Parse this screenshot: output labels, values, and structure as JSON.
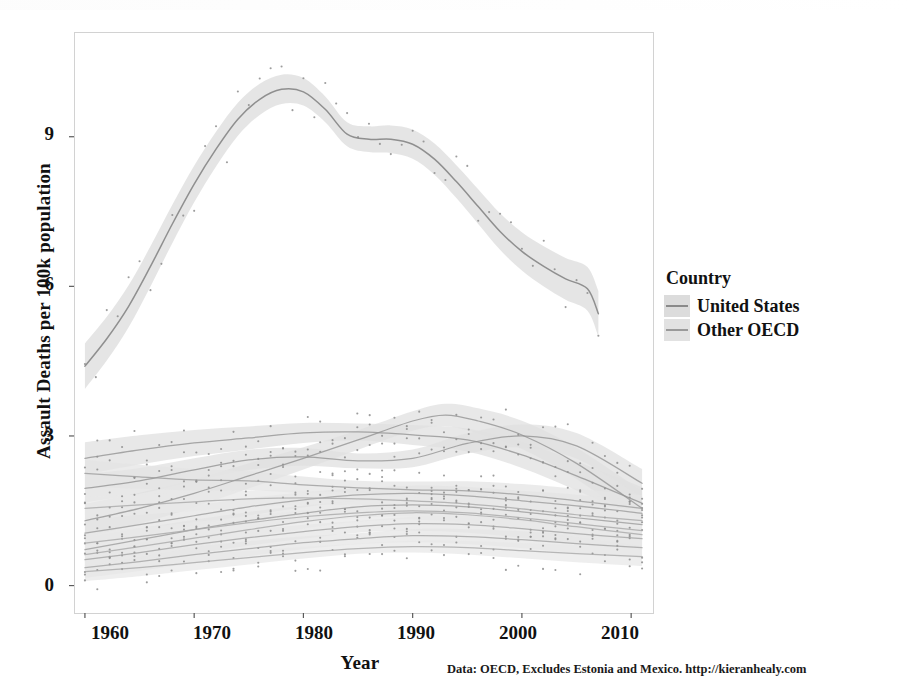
{
  "chart_data": {
    "type": "line",
    "title": "",
    "xlabel": "Year",
    "ylabel": "Assault Deaths per 100k population",
    "caption": "Data: OECD, Excludes Estonia and Mexico. http://kieranhealy.com",
    "xlim": [
      1959,
      2012
    ],
    "ylim": [
      -0.55,
      11.1
    ],
    "xticks": [
      1960,
      1970,
      1980,
      1990,
      2000,
      2010
    ],
    "yticks": [
      0,
      3,
      6,
      9
    ],
    "grid": false,
    "legend": {
      "title": "Country",
      "position": "right",
      "entries": [
        {
          "label": "United States",
          "line_color": "#8f8f8f",
          "ribbon_color": "#dedede"
        },
        {
          "label": "Other OECD",
          "line_color": "#9a9a9a",
          "ribbon_color": "#e2e2e2"
        }
      ]
    },
    "smoother": "loess with 95% confidence ribbon",
    "series": [
      {
        "name": "United States",
        "group": "United States",
        "line_color": "#8a8a8a",
        "ribbon_color": "#dcdcdc",
        "ribbon_halfwidth": 0.24,
        "x": [
          1960,
          1962,
          1964,
          1966,
          1968,
          1970,
          1972,
          1974,
          1976,
          1978,
          1980,
          1982,
          1984,
          1986,
          1988,
          1990,
          1992,
          1994,
          1996,
          1998,
          2000,
          2002,
          2004,
          2006,
          2007
        ],
        "y": [
          4.4,
          4.95,
          5.6,
          6.4,
          7.25,
          8.05,
          8.75,
          9.35,
          9.75,
          9.95,
          9.9,
          9.55,
          9.05,
          8.95,
          8.95,
          8.85,
          8.55,
          8.1,
          7.6,
          7.1,
          6.7,
          6.4,
          6.15,
          5.95,
          5.45
        ]
      },
      {
        "name": "Other OECD high band A",
        "group": "Other OECD",
        "line_color": "#949494",
        "ribbon_color": "#e0e0e0",
        "ribbon_halfwidth": 0.17,
        "x": [
          1960,
          1965,
          1970,
          1975,
          1980,
          1985,
          1990,
          1995,
          2000,
          2005,
          2011
        ],
        "y": [
          2.55,
          2.72,
          2.86,
          2.96,
          3.06,
          3.08,
          3.02,
          2.92,
          2.62,
          2.2,
          1.65
        ]
      },
      {
        "name": "Other OECD high band B",
        "group": "Other OECD",
        "line_color": "#949494",
        "ribbon_color": "#e0e0e0",
        "ribbon_halfwidth": 0.18,
        "x": [
          1960,
          1965,
          1970,
          1975,
          1980,
          1985,
          1990,
          1993,
          1996,
          2000,
          2005,
          2011
        ],
        "y": [
          1.3,
          1.55,
          1.85,
          2.2,
          2.55,
          2.92,
          3.3,
          3.42,
          3.3,
          3.02,
          2.45,
          1.55
        ]
      },
      {
        "name": "Other OECD high band C",
        "group": "Other OECD",
        "line_color": "#949494",
        "ribbon_color": "#e0e0e0",
        "ribbon_halfwidth": 0.15,
        "x": [
          1960,
          1965,
          1970,
          1975,
          1980,
          1985,
          1990,
          1995,
          2000,
          2005,
          2011
        ],
        "y": [
          1.95,
          2.1,
          2.32,
          2.52,
          2.58,
          2.5,
          2.55,
          2.85,
          3.0,
          2.8,
          2.05
        ]
      },
      {
        "name": "Other OECD mid band D",
        "group": "Other OECD",
        "line_color": "#9c9c9c",
        "ribbon_color": "#e4e4e4",
        "ribbon_halfwidth": 0.14,
        "x": [
          1960,
          1965,
          1970,
          1975,
          1980,
          1985,
          1990,
          1995,
          2000,
          2005,
          2011
        ],
        "y": [
          2.25,
          2.18,
          2.12,
          2.1,
          2.02,
          1.96,
          1.92,
          1.9,
          1.82,
          1.7,
          1.55
        ]
      },
      {
        "name": "Other OECD mid band E",
        "group": "Other OECD",
        "line_color": "#9c9c9c",
        "ribbon_color": "#e4e4e4",
        "ribbon_halfwidth": 0.13,
        "x": [
          1960,
          1965,
          1970,
          1975,
          1980,
          1985,
          1990,
          1995,
          2000,
          2005,
          2011
        ],
        "y": [
          1.05,
          1.22,
          1.4,
          1.58,
          1.72,
          1.82,
          1.85,
          1.8,
          1.7,
          1.6,
          1.45
        ]
      },
      {
        "name": "Other OECD mid band F",
        "group": "Other OECD",
        "line_color": "#9c9c9c",
        "ribbon_color": "#e4e4e4",
        "ribbon_halfwidth": 0.13,
        "x": [
          1960,
          1965,
          1970,
          1975,
          1980,
          1985,
          1990,
          1995,
          2000,
          2005,
          2011
        ],
        "y": [
          0.72,
          0.92,
          1.12,
          1.3,
          1.45,
          1.58,
          1.62,
          1.58,
          1.48,
          1.36,
          1.22
        ]
      },
      {
        "name": "Other OECD low band G",
        "group": "Other OECD",
        "line_color": "#a2a2a2",
        "ribbon_color": "#e6e6e6",
        "ribbon_halfwidth": 0.12,
        "x": [
          1960,
          1965,
          1970,
          1975,
          1980,
          1985,
          1990,
          1995,
          2000,
          2005,
          2011
        ],
        "y": [
          0.52,
          0.66,
          0.82,
          0.96,
          1.08,
          1.18,
          1.24,
          1.22,
          1.14,
          1.04,
          0.94
        ]
      },
      {
        "name": "Other OECD low band H",
        "group": "Other OECD",
        "line_color": "#a2a2a2",
        "ribbon_color": "#e6e6e6",
        "ribbon_halfwidth": 0.11,
        "x": [
          1960,
          1965,
          1970,
          1975,
          1980,
          1985,
          1990,
          1995,
          2000,
          2005,
          2011
        ],
        "y": [
          0.36,
          0.48,
          0.62,
          0.74,
          0.86,
          0.94,
          1.0,
          0.98,
          0.92,
          0.84,
          0.76
        ]
      },
      {
        "name": "Other OECD low band I",
        "group": "Other OECD",
        "line_color": "#a8a8a8",
        "ribbon_color": "#e8e8e8",
        "ribbon_halfwidth": 0.1,
        "x": [
          1960,
          1965,
          1970,
          1975,
          1980,
          1985,
          1990,
          1995,
          2000,
          2005,
          2011
        ],
        "y": [
          0.28,
          0.36,
          0.46,
          0.56,
          0.66,
          0.74,
          0.78,
          0.76,
          0.7,
          0.64,
          0.58
        ]
      },
      {
        "name": "Other OECD low band J",
        "group": "Other OECD",
        "line_color": "#a8a8a8",
        "ribbon_color": "#e8e8e8",
        "ribbon_halfwidth": 0.1,
        "x": [
          1960,
          1965,
          1970,
          1975,
          1980,
          1985,
          1990,
          1995,
          2000,
          2005,
          2011
        ],
        "y": [
          0.85,
          0.98,
          1.12,
          1.26,
          1.38,
          1.46,
          1.5,
          1.46,
          1.36,
          1.24,
          1.1
        ]
      },
      {
        "name": "Other OECD low band K",
        "group": "Other OECD",
        "line_color": "#a8a8a8",
        "ribbon_color": "#e8e8e8",
        "ribbon_halfwidth": 0.12,
        "x": [
          1960,
          1965,
          1970,
          1975,
          1980,
          1985,
          1990,
          1995,
          2000,
          2005,
          2011
        ],
        "y": [
          1.55,
          1.62,
          1.68,
          1.74,
          1.76,
          1.74,
          1.7,
          1.64,
          1.54,
          1.42,
          1.3
        ]
      },
      {
        "name": "Other OECD low band L",
        "group": "Other OECD",
        "line_color": "#a8a8a8",
        "ribbon_color": "#e8e8e8",
        "ribbon_halfwidth": 0.12,
        "x": [
          1960,
          1965,
          1970,
          1975,
          1980,
          1985,
          1990,
          1995,
          2000,
          2005,
          2011
        ],
        "y": [
          0.62,
          0.78,
          0.95,
          1.12,
          1.28,
          1.4,
          1.46,
          1.42,
          1.32,
          1.18,
          1.02
        ]
      }
    ]
  },
  "axis": {
    "x_tick_labels": [
      "1960",
      "1970",
      "1980",
      "1990",
      "2000",
      "2010"
    ],
    "y_tick_labels": [
      "0",
      "3",
      "6",
      "9"
    ],
    "x_title": "Year",
    "y_title": "Assault Deaths per 100k population"
  },
  "legend": {
    "title": "Country",
    "item_0": "United States",
    "item_1": "Other OECD"
  },
  "footer": {
    "caption": "Data: OECD, Excludes Estonia and Mexico. http://kieranhealy.com"
  }
}
